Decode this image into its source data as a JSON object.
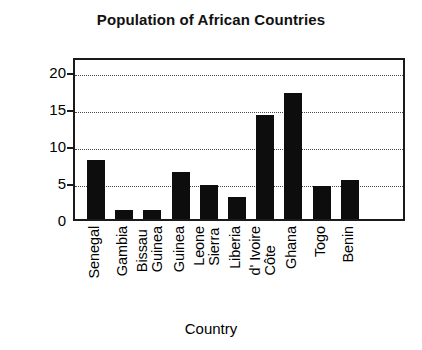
{
  "chart_data": {
    "type": "bar",
    "title": "Population of African Countries",
    "xlabel": "Country",
    "ylabel": "Population (millions)",
    "categories": [
      "Senegal",
      "Gambia",
      "Guinea Bissau",
      "Guinea",
      "Sierra Leone",
      "Liberia",
      "Côte d' Ivoire",
      "Ghana",
      "Togo",
      "Benin"
    ],
    "category_lines": [
      [
        "Senegal"
      ],
      [
        "Gambia"
      ],
      [
        "Guinea",
        "Bissau"
      ],
      [
        "Guinea"
      ],
      [
        "Sierra",
        "Leone"
      ],
      [
        "Liberia"
      ],
      [
        "Côte",
        "d' Ivoire"
      ],
      [
        "Ghana"
      ],
      [
        "Togo"
      ],
      [
        "Benin"
      ]
    ],
    "values": [
      8.0,
      1.2,
      1.2,
      6.3,
      4.6,
      3.0,
      14.0,
      17.0,
      4.5,
      5.2
    ],
    "ylim": [
      0,
      22
    ],
    "yticks": [
      0,
      5,
      10,
      15,
      20
    ],
    "ytick_labels": [
      "0",
      "5",
      "10",
      "15",
      "20"
    ],
    "grid": true,
    "grid_style": "dotted-horizontal",
    "legend": null,
    "bar_color": "#0d0d0d",
    "frame_color": "#1a1a1a",
    "background": "#ffffff"
  }
}
